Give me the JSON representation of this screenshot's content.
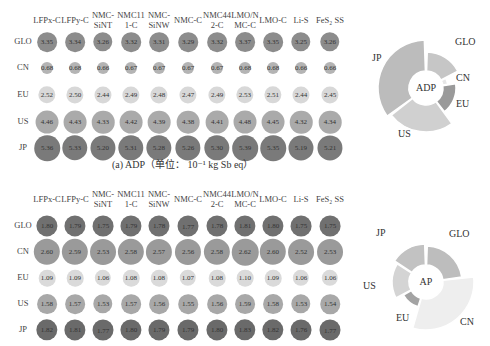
{
  "chart_data": [
    {
      "type": "bubble-table",
      "title": "(a) ADP (单位: 10⁻¹ kg Sb eq)",
      "unit": "10^-1 kg Sb eq",
      "columns": [
        "LFPx-C",
        "LFPy-C",
        "NMC-SiNT",
        "NMC111-C",
        "NMC-SiNW",
        "NMC-C",
        "NMC442-C",
        "LMO/NMC-C",
        "LMO-C",
        "Li-S",
        "FeS2 SS"
      ],
      "rows": [
        "GLO",
        "CN",
        "EU",
        "US",
        "JP"
      ],
      "values": [
        [
          3.35,
          3.34,
          3.26,
          3.32,
          3.31,
          3.29,
          3.32,
          3.37,
          3.35,
          3.25,
          3.26
        ],
        [
          0.68,
          0.68,
          0.66,
          0.67,
          0.67,
          0.67,
          0.67,
          0.68,
          0.68,
          0.66,
          0.66
        ],
        [
          2.52,
          2.5,
          2.44,
          2.49,
          2.48,
          2.47,
          2.49,
          2.53,
          2.51,
          2.44,
          2.45
        ],
        [
          4.46,
          4.43,
          4.33,
          4.42,
          4.39,
          4.38,
          4.41,
          4.48,
          4.45,
          4.32,
          4.34
        ],
        [
          5.36,
          5.33,
          5.2,
          5.31,
          5.28,
          5.26,
          5.3,
          5.39,
          5.35,
          5.19,
          5.21
        ]
      ]
    },
    {
      "type": "pie",
      "title": "ADP",
      "categories": [
        "GLO",
        "CN",
        "EU",
        "US",
        "JP"
      ],
      "values": [
        3.3,
        0.67,
        2.48,
        4.4,
        5.29
      ]
    },
    {
      "type": "bubble-table",
      "title": "(b) AP",
      "columns": [
        "LFPx-C",
        "LFPy-C",
        "NMC-SiNT",
        "NMC111-C",
        "NMC-SiNW",
        "NMC-C",
        "NMC442-C",
        "LMO/NMC-C",
        "LMO-C",
        "Li-S",
        "FeS2 SS"
      ],
      "rows": [
        "GLO",
        "CN",
        "EU",
        "US",
        "JP"
      ],
      "values": [
        [
          1.8,
          1.79,
          1.75,
          1.79,
          1.78,
          1.77,
          1.78,
          1.81,
          1.8,
          1.75,
          1.75
        ],
        [
          2.6,
          2.59,
          2.53,
          2.58,
          2.57,
          2.56,
          2.58,
          2.62,
          2.6,
          2.52,
          2.53
        ],
        [
          1.09,
          1.09,
          1.06,
          1.08,
          1.08,
          1.07,
          1.08,
          1.1,
          1.09,
          1.06,
          1.06
        ],
        [
          1.58,
          1.57,
          1.53,
          1.57,
          1.56,
          1.55,
          1.56,
          1.59,
          1.58,
          1.53,
          1.54
        ],
        [
          1.82,
          1.81,
          1.77,
          1.8,
          1.79,
          1.79,
          1.8,
          1.83,
          1.82,
          1.76,
          1.77
        ]
      ]
    },
    {
      "type": "pie",
      "title": "AP",
      "categories": [
        "GLO",
        "CN",
        "EU",
        "US",
        "JP"
      ],
      "values": [
        1.78,
        2.57,
        1.08,
        1.56,
        1.8
      ]
    }
  ],
  "top": {
    "header_labels": [
      "LFPx-C",
      "LFPy-C",
      "NMC-\nSiNT",
      "NMC11\n1-C",
      "NMC-\nSiNW",
      "NMC-C",
      "NMC44\n2-C",
      "LMO/N\nMC-C",
      "LMO-C",
      "Li-S",
      "FeS₂ SS"
    ],
    "row_labels": [
      "GLO",
      "CN",
      "EU",
      "US",
      "JP"
    ],
    "values": [
      [
        "3.35",
        "3.34",
        "3.26",
        "3.32",
        "3.31",
        "3.29",
        "3.32",
        "3.37",
        "3.35",
        "3.25",
        "3.26"
      ],
      [
        "0.68",
        "0.68",
        "0.66",
        "0.67",
        "0.67",
        "0.67",
        "0.67",
        "0.68",
        "0.68",
        "0.66",
        "0.66"
      ],
      [
        "2.52",
        "2.50",
        "2.44",
        "2.49",
        "2.48",
        "2.47",
        "2.49",
        "2.53",
        "2.51",
        "2.44",
        "2.45"
      ],
      [
        "4.46",
        "4.43",
        "4.33",
        "4.42",
        "4.39",
        "4.38",
        "4.41",
        "4.48",
        "4.45",
        "4.32",
        "4.34"
      ],
      [
        "5.36",
        "5.33",
        "5.20",
        "5.31",
        "5.28",
        "5.26",
        "5.30",
        "5.39",
        "5.35",
        "5.19",
        "5.21"
      ]
    ],
    "row_colors": [
      "#8c8c8c",
      "#b4b4b4",
      "#d8d8d8",
      "#aaaaaa",
      "#7a7a7a"
    ],
    "caption": "(a) ADP（单位： 10⁻¹ kg Sb eq）",
    "pie": {
      "center": "ADP",
      "labels": {
        "GLO": "GLO",
        "CN": "CN",
        "EU": "EU",
        "US": "US",
        "JP": "JP"
      }
    }
  },
  "bottom": {
    "header_labels": [
      "LFPx-C",
      "LFPy-C",
      "NMC-\nSiNT",
      "NMC11\n1-C",
      "NMC-\nSiNW",
      "NMC-C",
      "NMC44\n2-C",
      "LMO/N\nMC-C",
      "LMO-C",
      "Li-S",
      "FeS₂ SS"
    ],
    "row_labels": [
      "GLO",
      "CN",
      "EU",
      "US",
      "JP"
    ],
    "values": [
      [
        "1.80",
        "1.79",
        "1.75",
        "1.79",
        "1.78",
        "1.77",
        "1.78",
        "1.81",
        "1.80",
        "1.75",
        "1.75"
      ],
      [
        "2.60",
        "2.59",
        "2.53",
        "2.58",
        "2.57",
        "2.56",
        "2.58",
        "2.62",
        "2.60",
        "2.52",
        "2.53"
      ],
      [
        "1.09",
        "1.09",
        "1.06",
        "1.08",
        "1.08",
        "1.07",
        "1.08",
        "1.10",
        "1.09",
        "1.06",
        "1.06"
      ],
      [
        "1.58",
        "1.57",
        "1.53",
        "1.57",
        "1.56",
        "1.55",
        "1.56",
        "1.59",
        "1.58",
        "1.53",
        "1.54"
      ],
      [
        "1.82",
        "1.81",
        "1.77",
        "1.80",
        "1.79",
        "1.79",
        "1.80",
        "1.83",
        "1.82",
        "1.76",
        "1.77"
      ]
    ],
    "row_colors": [
      "#707070",
      "#9a9a9a",
      "#dadada",
      "#a8a8a8",
      "#6a6a6a"
    ],
    "pie": {
      "center": "AP",
      "labels": {
        "GLO": "GLO",
        "CN": "CN",
        "EU": "EU",
        "US": "US",
        "JP": "JP"
      }
    }
  }
}
